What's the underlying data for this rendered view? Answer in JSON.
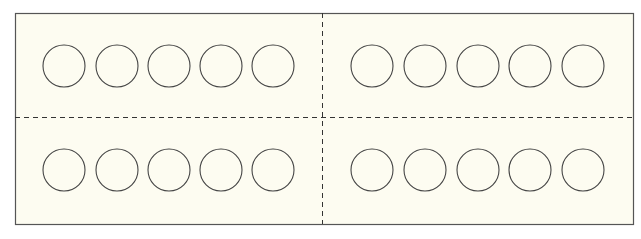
{
  "diagram": {
    "type": "ten-frame-card",
    "frame": {
      "x": 15,
      "y": 13,
      "width": 618,
      "height": 211,
      "fill": "#fdfcf1",
      "stroke": "#555555"
    },
    "dividers": {
      "vertical_x": 322,
      "horizontal_y": 117,
      "stroke": "#333333",
      "dash": "5,4"
    },
    "circle_radius": 21,
    "circle_stroke": "#444444",
    "panels": [
      {
        "name": "top-left",
        "row_y": 66,
        "circles_x": [
          64,
          117,
          169,
          221,
          273
        ]
      },
      {
        "name": "top-right",
        "row_y": 66,
        "circles_x": [
          372,
          425,
          478,
          530,
          583
        ]
      },
      {
        "name": "bottom-left",
        "row_y": 170,
        "circles_x": [
          64,
          117,
          169,
          221,
          273
        ]
      },
      {
        "name": "bottom-right",
        "row_y": 170,
        "circles_x": [
          372,
          425,
          478,
          530,
          583
        ]
      }
    ],
    "circles_per_panel": 5,
    "total_circles": 20
  }
}
